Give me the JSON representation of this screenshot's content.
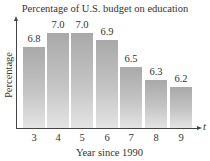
{
  "chart_data": {
    "type": "bar",
    "title": "Percentage of U.S. budget on education",
    "xlabel": "Year since 1990",
    "ylabel": "Percentage",
    "x_axis_variable": "t",
    "categories": [
      "3",
      "4",
      "5",
      "6",
      "7",
      "8",
      "9"
    ],
    "values": [
      6.8,
      7.0,
      7.0,
      6.9,
      6.5,
      6.3,
      6.2
    ],
    "value_labels": [
      "6.8",
      "7.0",
      "7.0",
      "6.9",
      "6.5",
      "6.3",
      "6.2"
    ],
    "grid": false,
    "legend": null,
    "y_ticks_shown": false,
    "bar_color": "#b5b5b5"
  },
  "labels": {
    "title": "Percentage of U.S. budget on education",
    "xlabel": "Year since 1990",
    "ylabel": "Percentage",
    "t": "t"
  }
}
